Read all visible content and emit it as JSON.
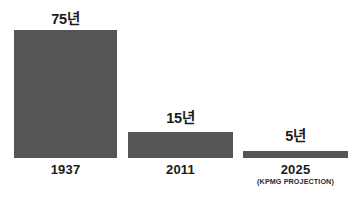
{
  "chart_data": {
    "type": "bar",
    "title": "",
    "subtitle": "",
    "xlabel": "",
    "ylabel": "",
    "categories": [
      "1937",
      "2011",
      "2025"
    ],
    "category_sublabels": [
      "",
      "",
      "(KPMG PROJECTION)"
    ],
    "values": [
      75,
      15,
      5
    ],
    "value_labels": [
      "75년",
      "15년",
      "5년"
    ],
    "unit": "년",
    "ylim": [
      0,
      75
    ],
    "grid": false,
    "legend": null,
    "bar_color": "#555555",
    "background_color": "#ffffff",
    "text_color": "#1b1b1b",
    "annotations": []
  },
  "bars": [
    {
      "value_label": "75년",
      "category": "1937",
      "sublabel": ""
    },
    {
      "value_label": "15년",
      "category": "2011",
      "sublabel": ""
    },
    {
      "value_label": "5년",
      "category": "2025",
      "sublabel": "(KPMG PROJECTION)"
    }
  ]
}
